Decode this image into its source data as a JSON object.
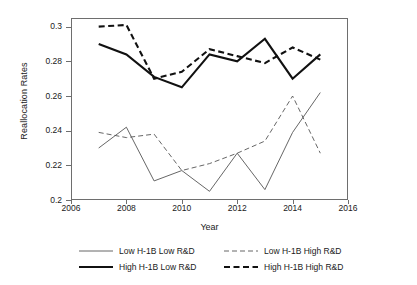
{
  "chart_data": {
    "type": "line",
    "title": "",
    "subtitle": "",
    "xlabel": "Year",
    "ylabel": "Reallocation Rates",
    "xlim": [
      2006,
      2016
    ],
    "ylim": [
      0.2,
      0.305
    ],
    "grid": false,
    "legend_position": "bottom",
    "x": [
      2007,
      2008,
      2009,
      2010,
      2011,
      2012,
      2013,
      2014,
      2015
    ],
    "xticks": [
      2006,
      2008,
      2010,
      2012,
      2014,
      2016
    ],
    "xticklabels": [
      "2006",
      "2008",
      "2010",
      "2012",
      "2014",
      "2016"
    ],
    "yticks": [
      0.2,
      0.22,
      0.24,
      0.26,
      0.28,
      0.3
    ],
    "yticklabels": [
      "0.2",
      "0.22",
      "0.24",
      "0.26",
      "0.28",
      "0.3"
    ],
    "series": [
      {
        "name": "Low H-1B Low R&D",
        "style": "thin-solid",
        "color": "#555555",
        "width": 0.9,
        "dash": "none",
        "values": [
          0.23,
          0.242,
          0.211,
          0.217,
          0.205,
          0.227,
          0.206,
          0.239,
          0.262
        ]
      },
      {
        "name": "Low H-1B High R&D",
        "style": "thin-dashed",
        "color": "#555555",
        "width": 0.9,
        "dash": "5,3",
        "values": [
          0.239,
          0.236,
          0.238,
          0.217,
          0.221,
          0.227,
          0.234,
          0.26,
          0.227
        ]
      },
      {
        "name": "High H-1B Low R&D",
        "style": "thick-solid",
        "color": "#111111",
        "width": 2.1,
        "dash": "none",
        "values": [
          0.29,
          0.284,
          0.271,
          0.265,
          0.284,
          0.28,
          0.293,
          0.27,
          0.284
        ]
      },
      {
        "name": "High H-1B High R&D",
        "style": "thick-dashed",
        "color": "#111111",
        "width": 2.1,
        "dash": "6,3.5",
        "values": [
          0.3,
          0.301,
          0.27,
          0.274,
          0.287,
          0.283,
          0.279,
          0.288,
          0.281
        ]
      }
    ]
  },
  "axes": {
    "y_title": "Reallocation Rates",
    "x_title": "Year"
  },
  "legend": {
    "entries": [
      {
        "label": "Low H-1B Low R&D"
      },
      {
        "label": "Low H-1B High R&D"
      },
      {
        "label": "High H-1B Low R&D"
      },
      {
        "label": "High H-1B High R&D"
      }
    ]
  },
  "colors": {
    "frame": "#6e6e6e",
    "thin_line": "#555555",
    "thick_line": "#111111",
    "background": "#ffffff",
    "text": "#1a1a1a"
  }
}
